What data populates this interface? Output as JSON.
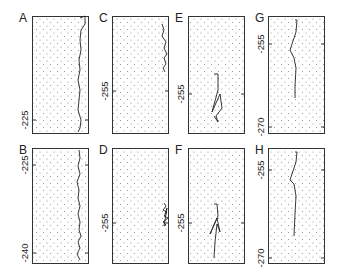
{
  "figure": {
    "layout": {
      "rows": 2,
      "cols": 4
    },
    "colors": {
      "frame": "#333333",
      "dots": "#8a8a8a",
      "trace": "#222222"
    },
    "panels": [
      {
        "id": "A",
        "label": "A",
        "box": [
          32,
          16,
          57,
          118
        ],
        "ticks": [
          {
            "label": "-225",
            "y": 104
          }
        ],
        "trace": [
          [
            48,
            2
          ],
          [
            53,
            0
          ],
          [
            53,
            8
          ],
          [
            49,
            14
          ],
          [
            48,
            24
          ],
          [
            49,
            34
          ],
          [
            47,
            44
          ],
          [
            48,
            54
          ],
          [
            46,
            64
          ],
          [
            48,
            74
          ],
          [
            47,
            84
          ],
          [
            46,
            94
          ],
          [
            49,
            104
          ],
          [
            48,
            112
          ],
          [
            46,
            116
          ]
        ]
      },
      {
        "id": "B",
        "label": "B",
        "box": [
          32,
          148,
          57,
          116
        ],
        "ticks": [
          {
            "label": "-225",
            "y": 17
          },
          {
            "label": "-240",
            "y": 105
          }
        ],
        "trace": [
          [
            47,
            2
          ],
          [
            48,
            10
          ],
          [
            46,
            18
          ],
          [
            48,
            26
          ],
          [
            45,
            34
          ],
          [
            47,
            42
          ],
          [
            46,
            50
          ],
          [
            48,
            58
          ],
          [
            46,
            66
          ],
          [
            48,
            74
          ],
          [
            47,
            82
          ],
          [
            49,
            88
          ],
          [
            46,
            94
          ],
          [
            48,
            100
          ],
          [
            45,
            106
          ],
          [
            48,
            112
          ]
        ]
      },
      {
        "id": "C",
        "label": "C",
        "box": [
          112,
          16,
          57,
          118
        ],
        "ticks": [
          {
            "label": "-255",
            "y": 75
          }
        ],
        "trace": [
          [
            50,
            8
          ],
          [
            52,
            14
          ],
          [
            50,
            20
          ],
          [
            54,
            26
          ],
          [
            52,
            32
          ],
          [
            55,
            38
          ],
          [
            52,
            42
          ],
          [
            54,
            48
          ],
          [
            51,
            52
          ],
          [
            53,
            56
          ]
        ]
      },
      {
        "id": "D",
        "label": "D",
        "box": [
          112,
          148,
          57,
          116
        ],
        "ticks": [
          {
            "label": "-255",
            "y": 75
          }
        ],
        "trace": [
          [
            52,
            55
          ],
          [
            54,
            58
          ],
          [
            51,
            62
          ],
          [
            55,
            64
          ],
          [
            52,
            68
          ],
          [
            56,
            70
          ],
          [
            51,
            74
          ],
          [
            54,
            77
          ],
          [
            52,
            78
          ],
          [
            55,
            60
          ],
          [
            53,
            66
          ]
        ]
      },
      {
        "id": "E",
        "label": "E",
        "box": [
          188,
          16,
          57,
          118
        ],
        "ticks": [
          {
            "label": "-255",
            "y": 78
          }
        ],
        "trace": [
          [
            26,
            58
          ],
          [
            30,
            58
          ],
          [
            30,
            74
          ],
          [
            24,
            96
          ],
          [
            32,
            78
          ],
          [
            34,
            92
          ],
          [
            28,
            100
          ],
          [
            30,
            106
          ],
          [
            26,
            100
          ]
        ]
      },
      {
        "id": "F",
        "label": "F",
        "box": [
          188,
          148,
          57,
          116
        ],
        "ticks": [
          {
            "label": "-255",
            "y": 75
          }
        ],
        "trace": [
          [
            26,
            56
          ],
          [
            29,
            56
          ],
          [
            30,
            68
          ],
          [
            22,
            86
          ],
          [
            29,
            70
          ],
          [
            32,
            84
          ],
          [
            29,
            76
          ],
          [
            27,
            94
          ],
          [
            26,
            110
          ]
        ]
      },
      {
        "id": "G",
        "label": "G",
        "box": [
          268,
          16,
          57,
          118
        ],
        "ticks": [
          {
            "label": "-255",
            "y": 28
          },
          {
            "label": "-270",
            "y": 111
          }
        ],
        "trace": [
          [
            27,
            4
          ],
          [
            29,
            4
          ],
          [
            28,
            16
          ],
          [
            22,
            34
          ],
          [
            26,
            42
          ],
          [
            28,
            52
          ],
          [
            27,
            70
          ],
          [
            27,
            82
          ]
        ]
      },
      {
        "id": "H",
        "label": "H",
        "box": [
          268,
          148,
          57,
          116
        ],
        "ticks": [
          {
            "label": "-255",
            "y": 22
          },
          {
            "label": "-270",
            "y": 110
          }
        ],
        "trace": [
          [
            27,
            4
          ],
          [
            29,
            4
          ],
          [
            28,
            14
          ],
          [
            22,
            32
          ],
          [
            26,
            36
          ],
          [
            28,
            48
          ],
          [
            27,
            66
          ],
          [
            26,
            88
          ]
        ]
      }
    ]
  }
}
